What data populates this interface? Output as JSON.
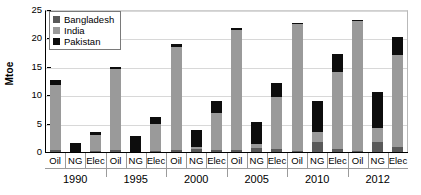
{
  "chart_data": {
    "type": "bar",
    "title": "",
    "subtitle": "",
    "xlabel": "",
    "ylabel": "Mtoe",
    "ylim": [
      0,
      25
    ],
    "yticks": [
      0,
      5,
      10,
      15,
      20,
      25
    ],
    "grid": true,
    "stacked": true,
    "legend_position": "top-left",
    "groups": [
      "1990",
      "1995",
      "2000",
      "2005",
      "2010",
      "2012"
    ],
    "categories": [
      "Oil",
      "NG",
      "Elec",
      "Oil",
      "NG",
      "Elec",
      "Oil",
      "NG",
      "Elec",
      "Oil",
      "NG",
      "Elec",
      "Oil",
      "NG",
      "Elec",
      "Oil",
      "NG",
      "Elec"
    ],
    "series": [
      {
        "name": "Bangladesh",
        "color": "#595959",
        "values": [
          0.4,
          0.0,
          0.2,
          0.3,
          0.0,
          0.15,
          0.35,
          0.6,
          0.35,
          0.35,
          0.7,
          0.55,
          0.2,
          1.7,
          0.55,
          0.2,
          1.8,
          0.85
        ]
      },
      {
        "name": "India",
        "color": "#9a9a9a",
        "values": [
          11.4,
          0.0,
          2.8,
          14.3,
          0.0,
          4.8,
          18.2,
          0.3,
          6.6,
          21.2,
          0.8,
          9.2,
          22.4,
          1.9,
          13.6,
          22.9,
          2.4,
          16.3
        ]
      },
      {
        "name": "Pakistan",
        "color": "#0d0d0d",
        "values": [
          0.8,
          1.6,
          0.6,
          0.3,
          2.9,
          1.15,
          0.45,
          3.0,
          2.05,
          0.25,
          3.75,
          2.35,
          0.2,
          5.3,
          3.15,
          0.2,
          6.4,
          3.15
        ]
      }
    ],
    "totals": [
      12.6,
      1.6,
      3.6,
      14.9,
      2.9,
      6.1,
      19.0,
      3.9,
      9.0,
      21.8,
      5.25,
      12.1,
      22.8,
      8.9,
      17.3,
      23.3,
      10.6,
      20.3
    ]
  },
  "legend": {
    "entries": [
      {
        "label": "Bangladesh",
        "swatch": "legend-swatch-bangladesh"
      },
      {
        "label": "India",
        "swatch": "legend-swatch-india"
      },
      {
        "label": "Pakistan",
        "swatch": "legend-swatch-pakistan"
      }
    ]
  },
  "axis": {
    "y_title": "Mtoe",
    "y_tick_labels": [
      "25",
      "20",
      "15",
      "10",
      "5",
      "0"
    ]
  }
}
